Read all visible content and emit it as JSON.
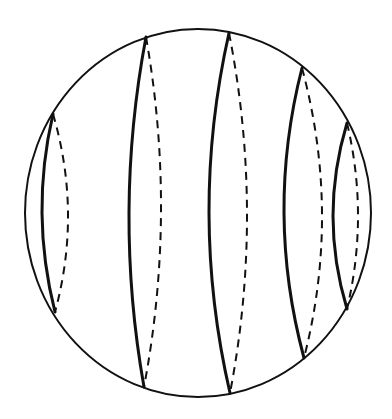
{
  "figure": {
    "caption": "",
    "outline": {
      "cx": 198,
      "cy": 213,
      "rx": 173,
      "ry": 184,
      "stroke": "#111111",
      "stroke_width": 2
    },
    "stroke_color": "#111111",
    "curves": [
      {
        "id": 1,
        "top": [
          53,
          114
        ],
        "bottom": [
          55,
          312
        ],
        "solid_mid_x": 42,
        "dashed_mid_x": 68
      },
      {
        "id": 2,
        "top": [
          146,
          37
        ],
        "bottom": [
          144,
          387
        ],
        "solid_mid_x": 129,
        "dashed_mid_x": 161
      },
      {
        "id": 3,
        "top": [
          229,
          33
        ],
        "bottom": [
          230,
          393
        ],
        "solid_mid_x": 209,
        "dashed_mid_x": 247
      },
      {
        "id": 4,
        "top": [
          302,
          68
        ],
        "bottom": [
          304,
          358
        ],
        "solid_mid_x": 284,
        "dashed_mid_x": 322
      },
      {
        "id": 5,
        "top": [
          347,
          123
        ],
        "bottom": [
          347,
          309
        ],
        "solid_mid_x": 333,
        "dashed_mid_x": 358
      }
    ],
    "legend": {
      "solid": "front (visible) arc",
      "dashed": "back (hidden) arc"
    }
  }
}
